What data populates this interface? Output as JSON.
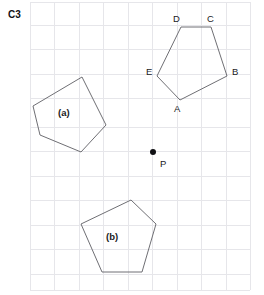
{
  "figure": {
    "corner_label": "C3",
    "width": 264,
    "height": 295,
    "background_color": "#ffffff"
  },
  "grid": {
    "line_color": "#e6e6ea",
    "spacing": 24.5,
    "x_start": 30,
    "x_end": 250,
    "y_start": 2,
    "y_end": 290,
    "vertical_x": [
      30,
      54.5,
      79,
      103.5,
      128,
      152.5,
      177,
      201.5,
      226,
      250
    ],
    "horizontal_y": [
      2,
      25,
      49.5,
      74,
      98.5,
      127,
      151.5,
      176,
      200.5,
      225,
      249.5,
      274,
      290
    ]
  },
  "shapes": [
    {
      "id": "pentagon-abcde",
      "label": "",
      "stroke_color": "#6f6f74",
      "points": "181,27 211,27 227,76 180,100 157,76",
      "vertices": [
        {
          "name": "D",
          "x": 181,
          "y": 27,
          "label_x": 173,
          "label_y": 22
        },
        {
          "name": "C",
          "x": 211,
          "y": 27,
          "label_x": 207,
          "label_y": 22
        },
        {
          "name": "B",
          "x": 227,
          "y": 76,
          "label_x": 232,
          "label_y": 75
        },
        {
          "name": "A",
          "x": 180,
          "y": 100,
          "label_x": 174,
          "label_y": 112
        },
        {
          "name": "E",
          "x": 157,
          "y": 76,
          "label_x": 146,
          "label_y": 75
        }
      ]
    },
    {
      "id": "pentagon-a",
      "label": "(a)",
      "label_x": 58,
      "label_y": 116,
      "stroke_color": "#6f6f74",
      "points": "82,77 106,125 81,152 40,135 33,106",
      "vertices": []
    },
    {
      "id": "pentagon-b",
      "label": "(b)",
      "label_x": 106,
      "label_y": 240,
      "stroke_color": "#6f6f74",
      "points": "131,200 156,224 142,272 102,272 81,224",
      "vertices": []
    }
  ],
  "points": [
    {
      "name": "P",
      "x": 153,
      "y": 152,
      "radius": 3,
      "color": "#111114",
      "label": "P",
      "label_x": 160,
      "label_y": 167
    }
  ]
}
